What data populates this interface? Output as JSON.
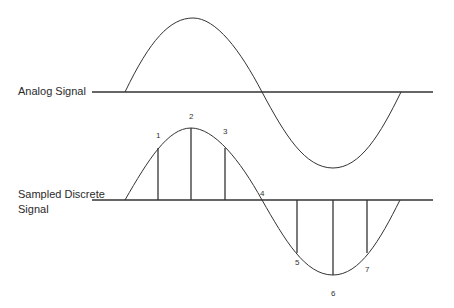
{
  "labels": {
    "analog": "Analog Signal",
    "sampled_line1": "Sampled Discrete",
    "sampled_line2": "Signal"
  },
  "samples": [
    {
      "n": "1",
      "x": 158,
      "y": 148
    },
    {
      "n": "2",
      "x": 191,
      "y": 128
    },
    {
      "n": "3",
      "x": 225,
      "y": 148
    },
    {
      "n": "4",
      "x": 262,
      "y": 200
    },
    {
      "n": "5",
      "x": 297,
      "y": 253
    },
    {
      "n": "6",
      "x": 333,
      "y": 275
    },
    {
      "n": "7",
      "x": 367,
      "y": 253
    }
  ],
  "colors": {
    "stroke": "#333333"
  }
}
